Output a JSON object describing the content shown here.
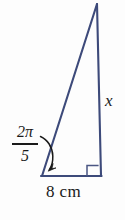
{
  "figure": {
    "type": "right-triangle-diagram",
    "background_color": "#fdfdfd",
    "stroke_color": "#3d4a7a",
    "text_color": "#1a1a1a",
    "canvas": {
      "width": 125,
      "height": 220
    },
    "vertices": {
      "apex": {
        "x": 97,
        "y": 4
      },
      "bottom_left": {
        "x": 42,
        "y": 176
      },
      "bottom_right": {
        "x": 101,
        "y": 176
      }
    },
    "right_angle_marker": {
      "name": "right-angle",
      "x": 87,
      "y": 165,
      "size": 11
    },
    "angle_arrow": {
      "name": "angle-arrow",
      "start": {
        "x": 41,
        "y": 137
      },
      "end": {
        "x": 49,
        "y": 170
      }
    }
  },
  "labels": {
    "angle_numerator": "2π",
    "angle_denominator": "5",
    "angle_full": "2π/5",
    "side_vertical": "x",
    "base": "8 cm"
  }
}
